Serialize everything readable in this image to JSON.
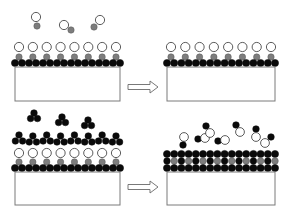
{
  "diagram": {
    "type": "atomic-layer-deposition-schematic",
    "colors": {
      "background": "#ffffff",
      "substrate_fill": "#ffffff",
      "substrate_stroke": "#7a7a7a",
      "black_atom": "#0a0a0a",
      "gray_atom": "#7d7d7d",
      "white_atom": "#ffffff",
      "atom_stroke": "#222222",
      "arrow_stroke": "#6a6a6a"
    },
    "panels": [
      {
        "id": "top-left",
        "label": "Before first half-reaction",
        "substrate": {
          "x": 15,
          "y": 67,
          "w": 105,
          "h": 34
        },
        "layers": [
          {
            "kind": "base-black",
            "y": 63
          },
          {
            "kind": "gray",
            "y": 57,
            "columns": 8
          },
          {
            "kind": "white",
            "y": 47,
            "columns": 8
          }
        ],
        "free_molecules": [
          {
            "type": "white-gray-pair",
            "x": 36,
            "y": 22
          },
          {
            "type": "white-gray-pair-tilted-right",
            "x": 66,
            "y": 28
          },
          {
            "type": "white-gray-pair-tilted-left",
            "x": 97,
            "y": 24
          }
        ]
      },
      {
        "id": "top-right",
        "label": "After first half-reaction",
        "substrate": {
          "x": 167,
          "y": 67,
          "w": 108,
          "h": 34
        },
        "layers": [
          {
            "kind": "base-black",
            "y": 63
          },
          {
            "kind": "gray",
            "y": 57,
            "columns": 8
          },
          {
            "kind": "white",
            "y": 47,
            "columns": 8
          }
        ],
        "free_molecules": []
      },
      {
        "id": "bottom-left",
        "label": "Before second half-reaction",
        "substrate": {
          "x": 15,
          "y": 172,
          "w": 105,
          "h": 33
        },
        "layers": [
          {
            "kind": "base-black",
            "y": 168
          },
          {
            "kind": "gray",
            "y": 162,
            "columns": 8
          },
          {
            "kind": "white",
            "y": 153,
            "columns": 8
          },
          {
            "kind": "black-trimer",
            "y": 140,
            "columns": 8
          }
        ],
        "free_molecules": [
          {
            "type": "black-trimer",
            "x": 34,
            "y": 117
          },
          {
            "type": "black-trimer",
            "x": 62,
            "y": 121
          },
          {
            "type": "black-trimer",
            "x": 88,
            "y": 124
          }
        ]
      },
      {
        "id": "bottom-right",
        "label": "After second half-reaction",
        "substrate": {
          "x": 167,
          "y": 172,
          "w": 108,
          "h": 33
        },
        "layers": [
          {
            "kind": "base-black",
            "y": 168
          },
          {
            "kind": "alternating-gray-black",
            "y": 161
          },
          {
            "kind": "top-black",
            "y": 154
          }
        ],
        "free_molecules": [
          {
            "type": "white-black-pair-vertical",
            "x": 184,
            "y": 141
          },
          {
            "type": "black-white-pair-horizontal",
            "x": 202,
            "y": 139
          },
          {
            "type": "black-white-pair-diagonal",
            "x": 208,
            "y": 130
          },
          {
            "type": "black-white-pair-horizontal",
            "x": 222,
            "y": 141
          },
          {
            "type": "black-white-pair-diagonal",
            "x": 238,
            "y": 129
          },
          {
            "type": "black-white-pair-vertical",
            "x": 256,
            "y": 134
          },
          {
            "type": "white-black-pair-diagonal",
            "x": 268,
            "y": 140
          }
        ]
      }
    ],
    "arrows": [
      {
        "id": "arrow-top",
        "x": 128,
        "y": 82,
        "w": 30,
        "h": 10,
        "direction": "right"
      },
      {
        "id": "arrow-bottom",
        "x": 128,
        "y": 182,
        "w": 30,
        "h": 10,
        "direction": "right"
      }
    ]
  }
}
